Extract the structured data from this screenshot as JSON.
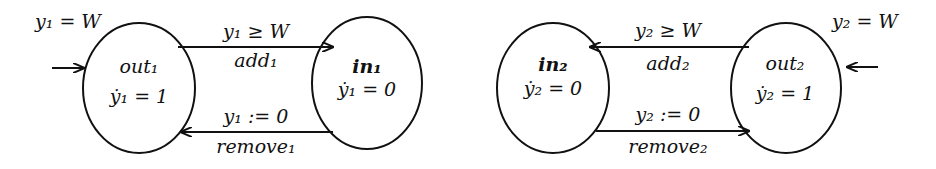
{
  "automata": [
    {
      "initial_label": "y₁ = W",
      "states": [
        {
          "id": "out1",
          "name": "out₁",
          "flow": "ẏ₁ = 1"
        },
        {
          "id": "in1",
          "name": "in₁",
          "flow": "ẏ₁ = 0"
        }
      ],
      "transitions": [
        {
          "from": "out1",
          "to": "in1",
          "guard": "y₁ ≥ W",
          "event": "add₁"
        },
        {
          "from": "in1",
          "to": "out1",
          "reset": "y₁ := 0",
          "event": "remove₁"
        }
      ]
    },
    {
      "initial_label": "y₂ = W",
      "states": [
        {
          "id": "in2",
          "name": "in₂",
          "flow": "ẏ₂ = 0"
        },
        {
          "id": "out2",
          "name": "out₂",
          "flow": "ẏ₂ = 1"
        }
      ],
      "transitions": [
        {
          "from": "out2",
          "to": "in2",
          "guard": "y₂ ≥ W",
          "event": "add₂"
        },
        {
          "from": "in2",
          "to": "out2",
          "reset": "y₂ := 0",
          "event": "remove₂"
        }
      ]
    }
  ]
}
